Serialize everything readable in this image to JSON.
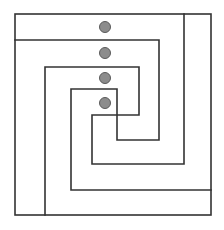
{
  "diagram": {
    "type": "nested-spiral-maze",
    "canvas": {
      "width": 224,
      "height": 230,
      "background": "#ffffff"
    },
    "stroke": {
      "color": "#333333",
      "width": 1.6
    },
    "outer_box": {
      "x1": 15,
      "y1": 14,
      "x2": 211,
      "y2": 215
    },
    "paths": [
      {
        "name": "spiral-path-a",
        "points": "15,40 159,40 159,140 117,140 117,89 71,89 71,190 211,190"
      },
      {
        "name": "spiral-path-b",
        "points": "45,215 45,67 139,67 139,115 92,115 92,164 184,164 184,14"
      }
    ],
    "dots": {
      "fill": "#8c8c8c",
      "stroke": "#5a5a5a",
      "radius": 5.5,
      "items": [
        {
          "cx": 105,
          "cy": 27
        },
        {
          "cx": 105,
          "cy": 53
        },
        {
          "cx": 105,
          "cy": 78
        },
        {
          "cx": 105,
          "cy": 103
        }
      ]
    }
  }
}
